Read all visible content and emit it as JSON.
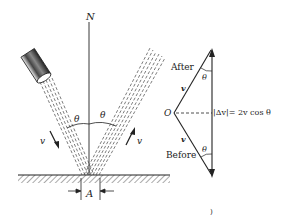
{
  "diagram": {
    "normal_label": "N",
    "angle_label": "θ",
    "velocity_label": "v",
    "area_label": "A",
    "vector_triangle": {
      "after_label": "After",
      "before_label": "Before",
      "origin_label": "O",
      "vector_label": "v",
      "delta_label": "|Δv|= 2v cos θ"
    },
    "footer_mark": ")"
  },
  "colors": {
    "ink": "#222222",
    "background": "#ffffff",
    "hatch": "#555555"
  }
}
